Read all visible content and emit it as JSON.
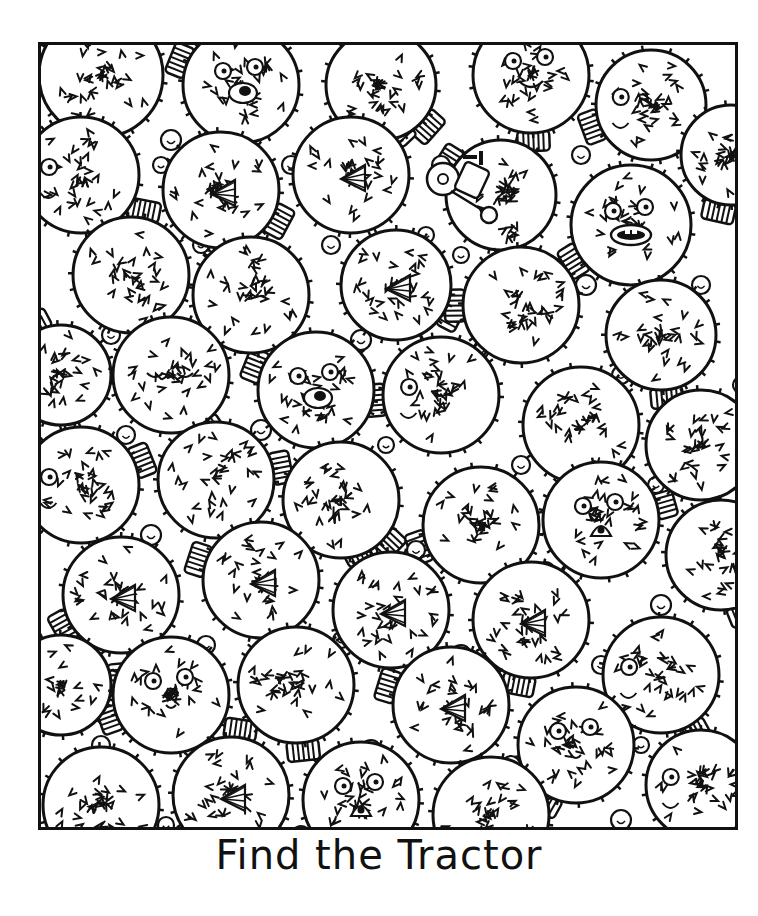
{
  "puzzle": {
    "title": "Find the Tractor",
    "hidden_object": "tractor",
    "theme": "pufferfish",
    "colors": {
      "ink": "#111111",
      "paper": "#ffffff"
    },
    "fish": [
      {
        "x": 60,
        "y": 30,
        "r": 62,
        "face": "none"
      },
      {
        "x": 200,
        "y": 40,
        "r": 58,
        "face": "open-mouth"
      },
      {
        "x": 340,
        "y": 40,
        "r": 55,
        "face": "none"
      },
      {
        "x": 490,
        "y": 30,
        "r": 58,
        "face": "smile"
      },
      {
        "x": 610,
        "y": 60,
        "r": 55,
        "face": "side"
      },
      {
        "x": 40,
        "y": 130,
        "r": 58,
        "face": "side-eye"
      },
      {
        "x": 180,
        "y": 145,
        "r": 58,
        "face": "beak"
      },
      {
        "x": 310,
        "y": 130,
        "r": 58,
        "face": "beak"
      },
      {
        "x": 460,
        "y": 150,
        "r": 55,
        "face": "none"
      },
      {
        "x": 590,
        "y": 180,
        "r": 60,
        "face": "teeth"
      },
      {
        "x": 690,
        "y": 110,
        "r": 50,
        "face": "none"
      },
      {
        "x": 90,
        "y": 230,
        "r": 58,
        "face": "none"
      },
      {
        "x": 210,
        "y": 250,
        "r": 58,
        "face": "none"
      },
      {
        "x": 355,
        "y": 240,
        "r": 55,
        "face": "beak"
      },
      {
        "x": 480,
        "y": 260,
        "r": 58,
        "face": "none"
      },
      {
        "x": 620,
        "y": 290,
        "r": 55,
        "face": "none"
      },
      {
        "x": 20,
        "y": 330,
        "r": 50,
        "face": "none"
      },
      {
        "x": 130,
        "y": 330,
        "r": 58,
        "face": "sleepy"
      },
      {
        "x": 275,
        "y": 345,
        "r": 58,
        "face": "puffer"
      },
      {
        "x": 400,
        "y": 350,
        "r": 58,
        "face": "side-eye"
      },
      {
        "x": 540,
        "y": 380,
        "r": 58,
        "face": "none"
      },
      {
        "x": 660,
        "y": 400,
        "r": 55,
        "face": "none"
      },
      {
        "x": 40,
        "y": 440,
        "r": 58,
        "face": "side-eye"
      },
      {
        "x": 175,
        "y": 435,
        "r": 58,
        "face": "none"
      },
      {
        "x": 300,
        "y": 455,
        "r": 58,
        "face": "none"
      },
      {
        "x": 440,
        "y": 480,
        "r": 58,
        "face": "none"
      },
      {
        "x": 560,
        "y": 475,
        "r": 58,
        "face": "surprised"
      },
      {
        "x": 680,
        "y": 510,
        "r": 55,
        "face": "none"
      },
      {
        "x": 80,
        "y": 550,
        "r": 58,
        "face": "beak"
      },
      {
        "x": 220,
        "y": 535,
        "r": 58,
        "face": "beak"
      },
      {
        "x": 350,
        "y": 565,
        "r": 58,
        "face": "beak"
      },
      {
        "x": 490,
        "y": 575,
        "r": 58,
        "face": "beak"
      },
      {
        "x": 620,
        "y": 630,
        "r": 58,
        "face": "side-eye"
      },
      {
        "x": 20,
        "y": 640,
        "r": 50,
        "face": "none"
      },
      {
        "x": 130,
        "y": 650,
        "r": 58,
        "face": "cute"
      },
      {
        "x": 255,
        "y": 640,
        "r": 58,
        "face": "none"
      },
      {
        "x": 410,
        "y": 660,
        "r": 58,
        "face": "beak"
      },
      {
        "x": 535,
        "y": 700,
        "r": 58,
        "face": "cute"
      },
      {
        "x": 60,
        "y": 760,
        "r": 58,
        "face": "none"
      },
      {
        "x": 190,
        "y": 750,
        "r": 58,
        "face": "beak"
      },
      {
        "x": 320,
        "y": 755,
        "r": 58,
        "face": "surprised"
      },
      {
        "x": 450,
        "y": 770,
        "r": 58,
        "face": "none"
      },
      {
        "x": 660,
        "y": 740,
        "r": 55,
        "face": "side-eye"
      }
    ],
    "bubbles": [
      [
        130,
        95,
        10
      ],
      [
        120,
        120,
        8
      ],
      [
        250,
        120,
        9
      ],
      [
        275,
        100,
        7
      ],
      [
        400,
        120,
        9
      ],
      [
        385,
        190,
        8
      ],
      [
        540,
        110,
        9
      ],
      [
        60,
        210,
        10
      ],
      [
        160,
        200,
        8
      ],
      [
        290,
        200,
        9
      ],
      [
        420,
        210,
        8
      ],
      [
        545,
        240,
        10
      ],
      [
        660,
        240,
        9
      ],
      [
        70,
        290,
        9
      ],
      [
        200,
        300,
        8
      ],
      [
        320,
        295,
        10
      ],
      [
        440,
        305,
        8
      ],
      [
        580,
        330,
        9
      ],
      [
        700,
        340,
        8
      ],
      [
        85,
        390,
        9
      ],
      [
        220,
        385,
        10
      ],
      [
        345,
        400,
        8
      ],
      [
        480,
        420,
        9
      ],
      [
        615,
        440,
        8
      ],
      [
        110,
        490,
        10
      ],
      [
        240,
        495,
        8
      ],
      [
        375,
        505,
        9
      ],
      [
        505,
        525,
        8
      ],
      [
        620,
        560,
        10
      ],
      [
        165,
        600,
        9
      ],
      [
        300,
        595,
        8
      ],
      [
        420,
        610,
        10
      ],
      [
        560,
        620,
        9
      ],
      [
        60,
        700,
        9
      ],
      [
        195,
        700,
        8
      ],
      [
        330,
        705,
        10
      ],
      [
        470,
        720,
        9
      ],
      [
        600,
        700,
        8
      ],
      [
        125,
        780,
        8
      ],
      [
        260,
        790,
        9
      ],
      [
        390,
        795,
        8
      ],
      [
        580,
        775,
        10
      ]
    ],
    "tractor": {
      "x": 388,
      "y": 92
    }
  }
}
